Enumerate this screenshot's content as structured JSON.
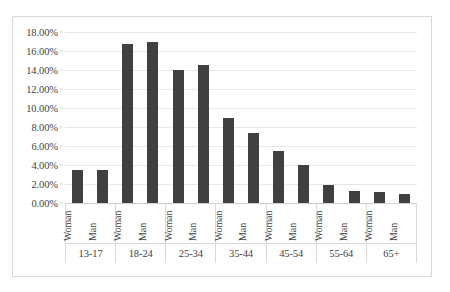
{
  "chart_data": {
    "type": "bar",
    "title": "",
    "subtitle": "",
    "xlabel": "",
    "ylabel": "",
    "ylim": [
      0,
      18
    ],
    "grid": true,
    "legend_position": "none",
    "y_tick_labels": [
      "18.00%",
      "16.00%",
      "14.00%",
      "12.00%",
      "10.00%",
      "8.00%",
      "6.00%",
      "4.00%",
      "2.00%",
      "0.00%"
    ],
    "y_tick_values": [
      18,
      16,
      14,
      12,
      10,
      8,
      6,
      4,
      2,
      0
    ],
    "categories": [
      "13-17",
      "18-24",
      "25-34",
      "35-44",
      "45-54",
      "55-64",
      "65+"
    ],
    "series_names": [
      "Woman",
      "Man"
    ],
    "series": [
      {
        "name": "Woman",
        "values": [
          3.5,
          16.7,
          14.0,
          9.0,
          5.5,
          1.85,
          1.15
        ]
      },
      {
        "name": "Man",
        "values": [
          3.5,
          17.0,
          14.55,
          7.35,
          4.0,
          1.25,
          0.9
        ]
      }
    ],
    "bar_color": "#404040",
    "gridline_color": "#e8e8e8",
    "border_color": "#d9d9d9"
  }
}
